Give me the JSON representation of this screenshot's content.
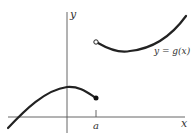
{
  "diagram": {
    "type": "function-graph",
    "axes": {
      "x_label": "x",
      "y_label": "y"
    },
    "function_label": "y = g(x)",
    "tick_label": "a",
    "points": {
      "open_circle": "upper branch start at x = a (excluded)",
      "filled_dot": "lower branch end at x = a (included)"
    },
    "colors": {
      "curve": "#222222",
      "axes": "#555555",
      "background": "#ffffff"
    }
  }
}
